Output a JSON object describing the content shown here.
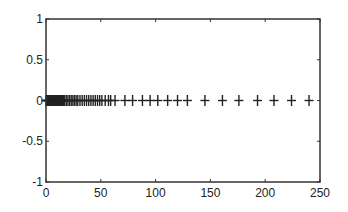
{
  "chart_data": {
    "type": "scatter",
    "title": "",
    "xlabel": "",
    "ylabel": "",
    "xlim": [
      0,
      250
    ],
    "ylim": [
      -1,
      1
    ],
    "grid": false,
    "legend": null,
    "marker": "+",
    "marker_color": "#222222",
    "x_ticks": [
      0,
      50,
      100,
      150,
      200,
      250
    ],
    "x_tick_labels": [
      "0",
      "50",
      "100",
      "150",
      "200",
      "250"
    ],
    "y_ticks": [
      1,
      0.5,
      0,
      -0.5,
      -1
    ],
    "y_tick_labels": [
      "1",
      "0.5",
      "0",
      "-0.5",
      "-1"
    ],
    "series": [
      {
        "name": "points",
        "x": [
          0,
          0.5,
          1,
          1.5,
          2,
          2.5,
          3,
          3.5,
          4,
          4.5,
          5,
          5.5,
          6,
          6.5,
          7,
          7.5,
          8,
          8.5,
          9,
          9.5,
          10,
          10.5,
          11,
          11.5,
          12,
          12.5,
          13,
          13.5,
          14,
          14.5,
          15,
          15.5,
          16,
          16.5,
          17,
          18.5,
          20,
          21.5,
          23,
          24.5,
          26,
          27.5,
          29,
          31,
          33,
          35,
          37,
          39,
          41,
          43,
          45,
          47,
          49,
          51,
          54,
          57,
          59,
          63,
          72,
          79,
          88,
          95,
          102,
          111,
          120,
          129,
          145,
          161,
          176,
          193,
          208,
          224,
          240
        ],
        "y_value": 0
      }
    ]
  }
}
